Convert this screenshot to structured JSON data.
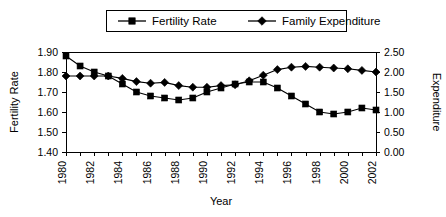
{
  "legend": {
    "position": "top-center",
    "entries": [
      {
        "label": "Fertility Rate",
        "marker": "square",
        "marker_icon": "legend-square-marker-icon"
      },
      {
        "label": "Family Expenditure",
        "marker": "diamond",
        "marker_icon": "legend-diamond-marker-icon"
      }
    ]
  },
  "axes": {
    "y_left_title": "Fertility Rate",
    "y_right_title": "Expenditure",
    "x_title": "Year",
    "y_left_ticks": [
      "1.40",
      "1.50",
      "1.60",
      "1.70",
      "1.80",
      "1.90"
    ],
    "y_right_ticks": [
      "0.00",
      "0.50",
      "1.00",
      "1.50",
      "2.00",
      "2.50"
    ],
    "x_ticks": [
      "1980",
      "1982",
      "1984",
      "1986",
      "1988",
      "1990",
      "1992",
      "1994",
      "1996",
      "1998",
      "2000",
      "2002"
    ]
  },
  "chart_data": {
    "type": "line",
    "title": "",
    "xlabel": "Year",
    "ylabel": "Fertility Rate",
    "y2label": "Expenditure",
    "grid": false,
    "legend_position": "top-center",
    "xlim": [
      1980,
      2002
    ],
    "ylim": [
      1.4,
      1.9
    ],
    "y2lim": [
      0.0,
      2.5
    ],
    "x": [
      1980,
      1981,
      1982,
      1983,
      1984,
      1985,
      1986,
      1987,
      1988,
      1989,
      1990,
      1991,
      1992,
      1993,
      1994,
      1995,
      1996,
      1997,
      1998,
      1999,
      2000,
      2001,
      2002
    ],
    "series": [
      {
        "name": "Fertility Rate",
        "axis": "left",
        "marker": "square",
        "values": [
          1.88,
          1.83,
          1.8,
          1.78,
          1.74,
          1.7,
          1.68,
          1.67,
          1.66,
          1.67,
          1.7,
          1.72,
          1.74,
          1.75,
          1.75,
          1.72,
          1.68,
          1.64,
          1.6,
          1.59,
          1.6,
          1.62,
          1.61
        ]
      },
      {
        "name": "Family Expenditure",
        "axis": "right",
        "marker": "diamond",
        "values": [
          1.9,
          1.9,
          1.9,
          1.9,
          1.84,
          1.76,
          1.72,
          1.74,
          1.66,
          1.62,
          1.62,
          1.66,
          1.68,
          1.78,
          1.92,
          2.06,
          2.12,
          2.14,
          2.12,
          2.1,
          2.08,
          2.04,
          2.0
        ]
      }
    ]
  },
  "colors": {
    "series": "#000000",
    "axis": "#000000",
    "background": "#ffffff"
  }
}
